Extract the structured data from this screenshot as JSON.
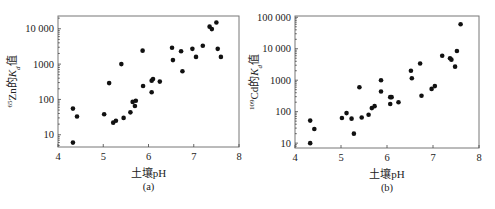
{
  "chart_data": [
    {
      "type": "scatter",
      "panel_label": "(a)",
      "xlabel": "土壤pH",
      "ylabel_parts": {
        "superscript": "65",
        "main": "Zn的",
        "italic": "K",
        "subscript": "d",
        "suffix": "值"
      },
      "xlim": [
        4,
        8
      ],
      "ylim": [
        4.5,
        23000
      ],
      "yscale": "log",
      "xticks": [
        4,
        5,
        6,
        7,
        8
      ],
      "xtick_labels": [
        "4",
        "5",
        "6",
        "7",
        "8"
      ],
      "yticks": [
        10,
        100,
        1000,
        10000
      ],
      "ytick_labels": [
        "10",
        "100",
        "1000",
        "10 000"
      ],
      "grid": false,
      "legend": "none",
      "points": [
        [
          4.33,
          6
        ],
        [
          4.33,
          55
        ],
        [
          4.42,
          33
        ],
        [
          5.02,
          38
        ],
        [
          5.13,
          290
        ],
        [
          5.4,
          1000
        ],
        [
          5.22,
          22
        ],
        [
          5.28,
          25
        ],
        [
          5.45,
          30
        ],
        [
          5.6,
          43
        ],
        [
          5.65,
          85
        ],
        [
          5.72,
          92
        ],
        [
          5.7,
          65
        ],
        [
          5.87,
          2400
        ],
        [
          5.88,
          240
        ],
        [
          6.07,
          160
        ],
        [
          6.07,
          340
        ],
        [
          6.1,
          380
        ],
        [
          6.25,
          320
        ],
        [
          6.52,
          2900
        ],
        [
          6.54,
          1300
        ],
        [
          6.72,
          2300
        ],
        [
          6.75,
          630
        ],
        [
          6.97,
          2700
        ],
        [
          7.05,
          1600
        ],
        [
          7.2,
          3300
        ],
        [
          7.35,
          11500
        ],
        [
          7.4,
          9800
        ],
        [
          7.5,
          15000
        ],
        [
          7.53,
          2700
        ],
        [
          7.6,
          1600
        ]
      ]
    },
    {
      "type": "scatter",
      "panel_label": "(b)",
      "xlabel": "土壤pH",
      "ylabel_parts": {
        "superscript": "109",
        "main": "Cd的",
        "italic": "K",
        "subscript": "d",
        "suffix": "值"
      },
      "xlim": [
        4,
        8
      ],
      "ylim": [
        7,
        110000
      ],
      "yscale": "log",
      "xticks": [
        4,
        5,
        6,
        7,
        8
      ],
      "xtick_labels": [
        "4",
        "5",
        "6",
        "7",
        "8"
      ],
      "yticks": [
        10,
        100,
        1000,
        10000,
        100000
      ],
      "ytick_labels": [
        "10",
        "100",
        "1000",
        "10 000",
        "100 000"
      ],
      "grid": false,
      "legend": "none",
      "points": [
        [
          4.33,
          10
        ],
        [
          4.33,
          52
        ],
        [
          4.42,
          28
        ],
        [
          5.02,
          63
        ],
        [
          5.12,
          90
        ],
        [
          5.23,
          60
        ],
        [
          5.28,
          20
        ],
        [
          5.4,
          600
        ],
        [
          5.45,
          65
        ],
        [
          5.6,
          80
        ],
        [
          5.67,
          130
        ],
        [
          5.73,
          150
        ],
        [
          5.87,
          1000
        ],
        [
          5.87,
          440
        ],
        [
          6.07,
          290
        ],
        [
          6.07,
          175
        ],
        [
          6.1,
          290
        ],
        [
          6.25,
          200
        ],
        [
          6.52,
          2000
        ],
        [
          6.54,
          1150
        ],
        [
          6.72,
          3400
        ],
        [
          6.75,
          320
        ],
        [
          6.97,
          530
        ],
        [
          7.04,
          650
        ],
        [
          7.2,
          6000
        ],
        [
          7.37,
          5000
        ],
        [
          7.4,
          4500
        ],
        [
          7.48,
          2700
        ],
        [
          7.52,
          8500
        ],
        [
          7.6,
          60000
        ]
      ]
    }
  ]
}
